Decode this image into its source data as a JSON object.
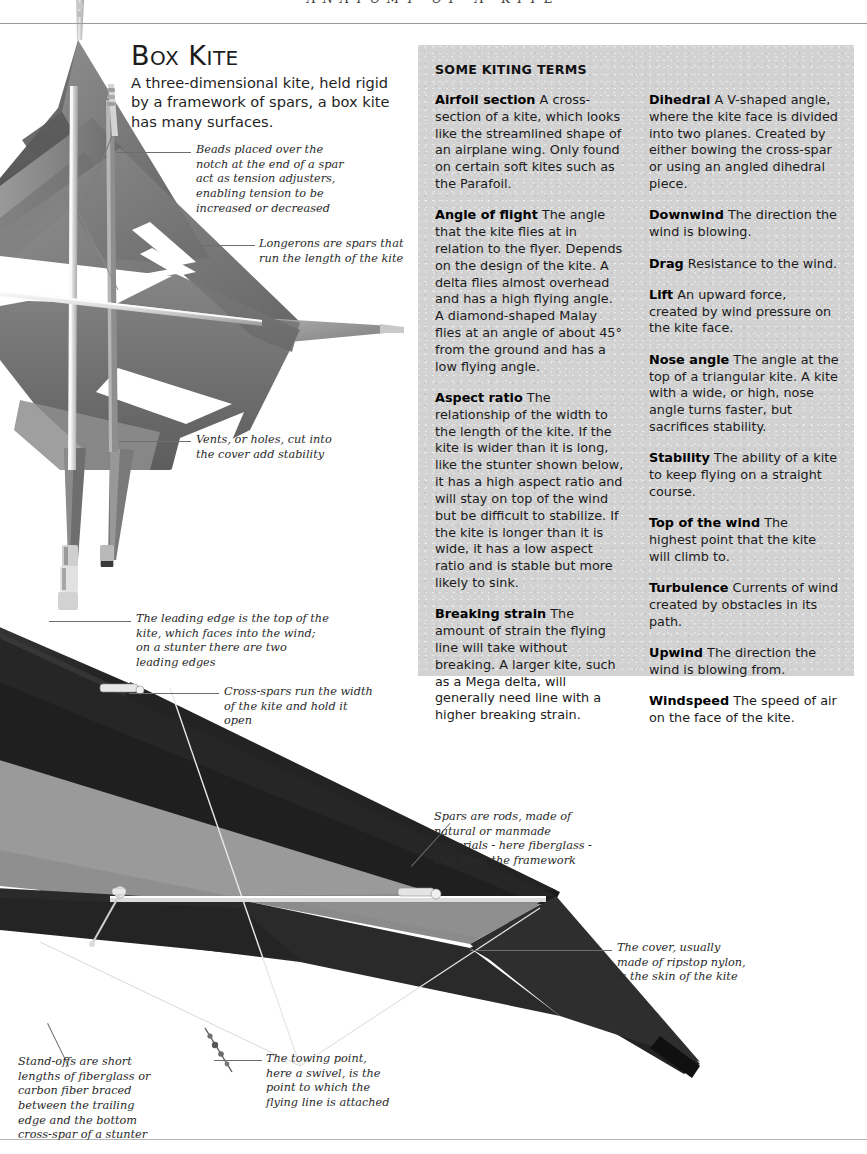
{
  "running_head": "ANATOMY OF A KITE",
  "heading": {
    "title_big": "B",
    "title_rest": "OX ",
    "title_big2": "K",
    "title_rest2": "ITE",
    "title_plain": "Box Kite",
    "subtitle": "A three-dimensional kite, held rigid by a framework of spars, a box kite has many surfaces."
  },
  "terms_panel": {
    "heading": "SOME KITING TERMS",
    "left_column": [
      {
        "term": "Airfoil section",
        "definition": "A cross-section of a kite, which looks like the streamlined shape of an airplane wing. Only found on certain soft kites such as the Parafoil."
      },
      {
        "term": "Angle of flight",
        "definition": "The angle that the kite flies at in relation to the flyer. Depends on the design of the kite. A delta flies almost overhead and has a high flying angle. A diamond-shaped Malay flies at an angle of about 45° from the ground and has a low flying angle."
      },
      {
        "term": "Aspect ratio",
        "definition": "The relationship of the width to the length of the kite. If the kite is wider than it is long, like the stunter shown below, it has a high aspect ratio and will stay on top of the wind but be difficult to stabilize. If the kite is longer than it is wide, it has a low aspect ratio and is stable but more likely to sink."
      },
      {
        "term": "Breaking strain",
        "definition": "The amount of strain the flying line will take without breaking. A larger kite, such as a Mega delta, will generally need line with a higher breaking strain."
      }
    ],
    "right_column": [
      {
        "term": "Dihedral",
        "definition": "A V-shaped angle, where the kite face is divided into two planes. Created by either bowing the cross-spar or using an angled dihedral piece."
      },
      {
        "term": "Downwind",
        "definition": "The direction the wind is blowing."
      },
      {
        "term": "Drag",
        "definition": "Resistance to the wind."
      },
      {
        "term": "Lift",
        "definition": "An upward force, created by wind pressure on the kite face."
      },
      {
        "term": "Nose angle",
        "definition": "The angle at the top of a triangular kite. A kite with a wide, or high, nose angle turns faster, but sacrifices stability."
      },
      {
        "term": "Stability",
        "definition": "The ability of a kite to keep flying on a straight course."
      },
      {
        "term": "Top of the wind",
        "definition": "The highest point that the kite will climb to."
      },
      {
        "term": "Turbulence",
        "definition": "Currents of wind created by obstacles in its path."
      },
      {
        "term": "Upwind",
        "definition": "The direction the wind is blowing from."
      },
      {
        "term": "Windspeed",
        "definition": "The speed of air on the face of the kite."
      }
    ]
  },
  "callouts": {
    "beads": "Beads placed over the notch at the end of a spar act as tension adjusters, enabling tension to be increased or decreased",
    "longerons": "Longerons are spars that run the length of the kite",
    "vents": "Vents, or holes, cut into the cover add stability",
    "leading_edge": "The leading edge is the top of the kite, which faces into the wind; on a stunter there are two leading edges",
    "cross_spars": "Cross-spars run the width of the kite and hold it open",
    "spars": "Spars are rods, made of natural or manmade materials - here fiberglass - that form the framework",
    "cover": "The cover, usually made of ripstop nylon, is the skin of the kite",
    "stand_offs": "Stand-offs are short lengths of fiberglass or carbon fiber braced between the trailing edge and the bottom cross-spar of a stunter",
    "towing_point": "The towing point, here a swivel, is the point to which the flying line is attached"
  },
  "colors": {
    "panel_background": "#d2d2d2",
    "sail_dark": "#2b2b2b",
    "sail_mid": "#7b7b7b",
    "sail_light": "#a8a8a8",
    "spar_light": "#d8d8d8",
    "rule": "#9a9a9a",
    "text": "#1b1b1b"
  }
}
